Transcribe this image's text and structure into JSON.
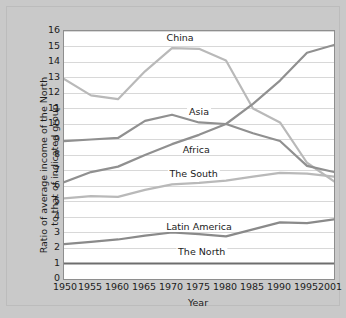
{
  "chart_data": {
    "type": "line",
    "title": "",
    "xlabel": "Year",
    "ylabel": "Ratio of average income of the North to that of indicated group",
    "ylabel_line1": "Ratio of average income of the North",
    "ylabel_line2": "to that of indicated group",
    "categories": [
      "1950",
      "1955",
      "1960",
      "1965",
      "1970",
      "1975",
      "1980",
      "1985",
      "1990",
      "1995",
      "2001"
    ],
    "x": [
      1950,
      1955,
      1960,
      1965,
      1970,
      1975,
      1980,
      1985,
      1990,
      1995,
      2001
    ],
    "xlim": [
      1950,
      2001
    ],
    "ylim": [
      0,
      16
    ],
    "yticks": [
      0,
      1,
      2,
      3,
      4,
      5,
      6,
      7,
      8,
      9,
      10,
      11,
      12,
      13,
      14,
      15,
      16
    ],
    "ytick_labels": [
      "0",
      "1",
      "2",
      "3",
      "4",
      "5",
      "6",
      "7",
      "8",
      "9",
      "10",
      "11",
      "12",
      "13",
      "14",
      "15",
      "16"
    ],
    "grid": "horizontal",
    "legend": "inline-labels",
    "series": [
      {
        "name": "China",
        "color": "#b9b9b9",
        "width": 2.2,
        "values": [
          12.9,
          11.85,
          11.6,
          13.4,
          14.9,
          14.85,
          14.1,
          11.0,
          10.1,
          7.5,
          6.3
        ],
        "label_x": 1971.5,
        "label_y": 15.55
      },
      {
        "name": "Asia",
        "color": "#909090",
        "width": 2.2,
        "values": [
          8.9,
          9.0,
          9.1,
          10.2,
          10.6,
          10.1,
          10.0,
          9.4,
          8.9,
          7.3,
          6.9
        ],
        "label_x": 1975.0,
        "label_y": 10.75
      },
      {
        "name": "Africa",
        "color": "#909090",
        "width": 2.2,
        "values": [
          6.25,
          6.9,
          7.25,
          8.0,
          8.7,
          9.3,
          10.0,
          11.3,
          12.8,
          14.6,
          15.1
        ],
        "label_x": 1974.5,
        "label_y": 8.35
      },
      {
        "name": "The South",
        "color": "#b9b9b9",
        "width": 2.2,
        "values": [
          5.2,
          5.35,
          5.3,
          5.75,
          6.1,
          6.2,
          6.35,
          6.6,
          6.85,
          6.8,
          6.6
        ],
        "label_x": 1974.0,
        "label_y": 6.8
      },
      {
        "name": "Latin America",
        "color": "#8a8a8a",
        "width": 2.2,
        "values": [
          2.25,
          2.4,
          2.55,
          2.8,
          3.0,
          2.9,
          2.75,
          3.2,
          3.65,
          3.6,
          3.85
        ],
        "label_x": 1975.0,
        "label_y": 3.35
      },
      {
        "name": "The North",
        "color": "#6e6e6e",
        "width": 2.2,
        "values": [
          1.0,
          1.0,
          1.0,
          1.0,
          1.0,
          1.0,
          1.0,
          1.0,
          1.0,
          1.0,
          1.0
        ],
        "label_x": 1975.5,
        "label_y": 1.75
      }
    ]
  },
  "style": {
    "background": "#c9c9c9",
    "plot_background": "#ffffff",
    "grid_color": "#d8d8d8",
    "axis_color": "#8e8e8e",
    "text_color": "#1c1c1c"
  }
}
